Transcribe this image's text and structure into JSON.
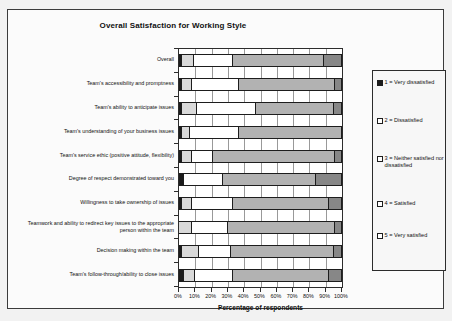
{
  "chart_data": {
    "type": "bar",
    "orientation": "horizontal",
    "stacked": true,
    "normalized": true,
    "title": "Overall Satisfaction for Working Style",
    "xlabel": "Percentage of respondents",
    "ylabel": "",
    "xlim": [
      0,
      100
    ],
    "xticks": [
      0,
      10,
      20,
      30,
      40,
      50,
      60,
      70,
      80,
      90,
      100
    ],
    "xticklabels": [
      "0%",
      "10%",
      "20%",
      "30%",
      "40%",
      "50%",
      "60%",
      "70%",
      "80%",
      "90%",
      "100%"
    ],
    "grid": "vertical",
    "legend_position": "right-outside",
    "categories": [
      "Overall",
      "Team's accessibility and promptness",
      "Team's ability to anticipate issues",
      "Team's understanding of your business issues",
      "Team's service ethic (positive attitude, flexibility)",
      "Degree of respect demonstrated toward you",
      "Willingness to take ownership of issues",
      "Teamwork and ability to redirect key issues to the appropriate person within the team",
      "Decision making within the team",
      "Team's follow-through/ability to close issues"
    ],
    "series": [
      {
        "name": "1 = Very dissatisfied",
        "color": "#1b1b1b",
        "values": [
          2,
          2,
          2,
          2,
          2,
          3,
          2,
          0,
          2,
          3
        ]
      },
      {
        "name": "2 = Dissatisfied",
        "color": "#d9d9d9",
        "values": [
          7,
          6,
          9,
          5,
          6,
          0,
          6,
          8,
          10,
          7
        ]
      },
      {
        "name": "3 = Neither satisfied nor dissatisfied",
        "color": "#ffffff",
        "values": [
          24,
          29,
          36,
          30,
          13,
          24,
          25,
          22,
          20,
          23
        ]
      },
      {
        "name": "4 = Satisfied",
        "color": "#b2b2b2",
        "values": [
          56,
          59,
          48,
          63,
          75,
          57,
          59,
          66,
          63,
          59
        ]
      },
      {
        "name": "5 = Very satisfied",
        "color": "#878787",
        "values": [
          11,
          4,
          5,
          0,
          4,
          16,
          8,
          4,
          5,
          8
        ]
      }
    ]
  },
  "legend": {
    "items": [
      {
        "label": "1 = Very dissatisfied"
      },
      {
        "label": "2 = Dissatisfied"
      },
      {
        "label": "3 = Neither satisfied nor dissatisfied"
      },
      {
        "label": "4 = Satisfied"
      },
      {
        "label": "5 = Very satisfied"
      }
    ]
  }
}
